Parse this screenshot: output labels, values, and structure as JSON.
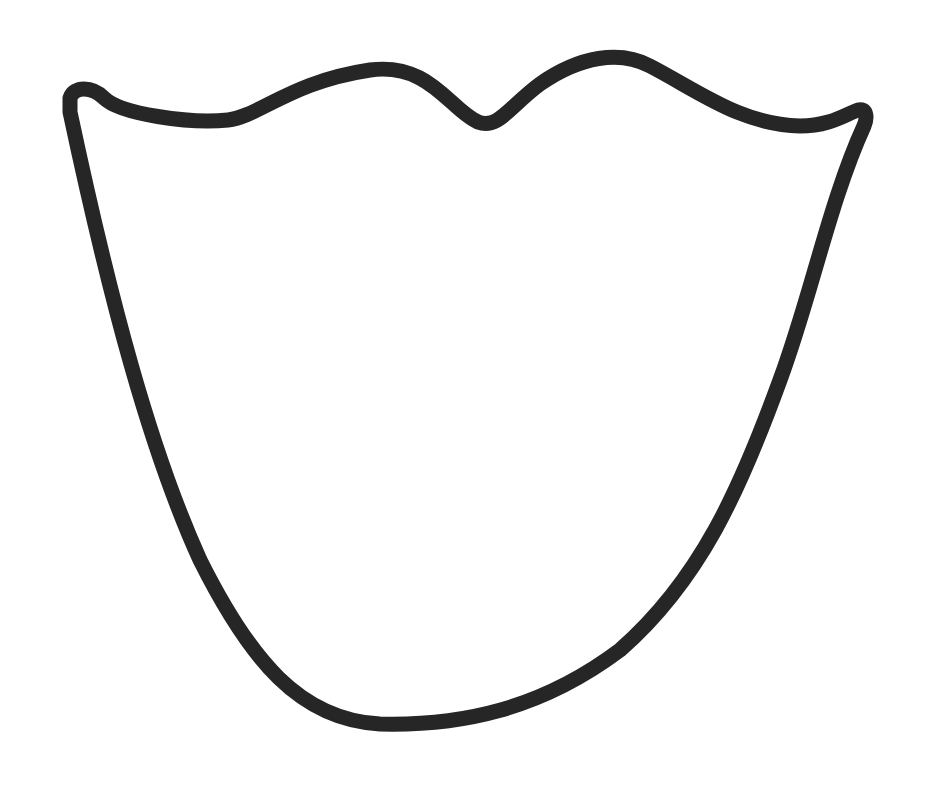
{
  "canvas": {
    "width": 928,
    "height": 786,
    "background": "#ffffff"
  },
  "shape": {
    "name": "lips-shield-outline",
    "stroke": "#262626",
    "stroke_width": 15,
    "fill": "none"
  }
}
